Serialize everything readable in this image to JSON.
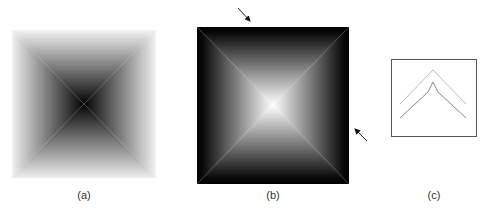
{
  "figure": {
    "panels": [
      {
        "id": "a",
        "label": "(a)",
        "description": "pyramid intensity map, dark center fading to white edges"
      },
      {
        "id": "b",
        "label": "(b)",
        "description": "inverted pyramid, bright center fading to black edges, with two arrows"
      },
      {
        "id": "c",
        "label": "(c)",
        "description": "box containing two chevron profile lines"
      }
    ],
    "colors": {
      "a_center": "#0a0a0a",
      "a_edge": "#f2f2f2",
      "b_center": "#ffffff",
      "b_edge": "#000000",
      "c_box": "#555555",
      "c_line_upper": "#bbbbbb",
      "c_line_lower": "#888888"
    }
  }
}
